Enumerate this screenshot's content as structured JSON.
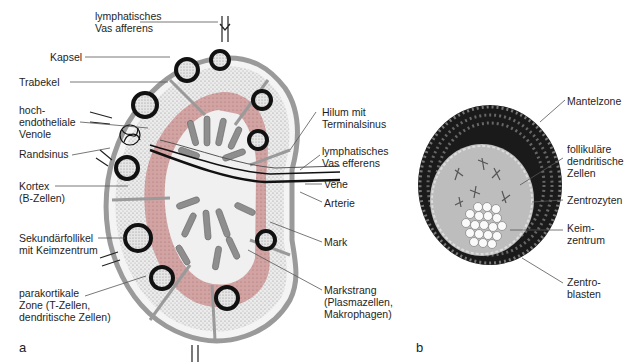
{
  "figure_a": {
    "panel_label": "a",
    "labels": {
      "vas_afferens_top": [
        "lymphatisches",
        "Vas afferens"
      ],
      "kapsel": [
        "Kapsel"
      ],
      "trabekel": [
        "Trabekel"
      ],
      "venole": [
        "hoch-",
        "endotheliale",
        "Venole"
      ],
      "randsinus": [
        "Randsinus"
      ],
      "kortex": [
        "Kortex",
        "(B-Zellen)"
      ],
      "sekundaerfollikel": [
        "Sekundärfollikel",
        "mit Keimzentrum"
      ],
      "parakortikal": [
        "parakortikale",
        "Zone (T-Zellen,",
        "dendritische Zellen)"
      ],
      "hilum": [
        "Hilum mit",
        "Terminalsinus"
      ],
      "vas_efferens": [
        "lymphatisches",
        "Vas efferens"
      ],
      "vene": [
        "Vene"
      ],
      "arterie": [
        "Arterie"
      ],
      "mark": [
        "Mark"
      ],
      "markstrang": [
        "Markstrang",
        "(Plasmazellen,",
        "Makrophagen)"
      ]
    }
  },
  "figure_b": {
    "panel_label": "b",
    "labels": {
      "mantelzone": [
        "Mantelzone"
      ],
      "fdc": [
        "follikuläre",
        "dendritische",
        "Zellen"
      ],
      "zentrozyten": [
        "Zentrozyten"
      ],
      "keimzentrum": [
        "Keim-",
        "zentrum"
      ],
      "zentroblasten": [
        "Zentro-",
        "blasten"
      ]
    }
  },
  "colors": {
    "capsule": "#9a9a9a",
    "cortex_stipple": "#d9d9d9",
    "paracortex": "#c98f8f",
    "medulla": "#8e8e8e",
    "follicle_ring": "#111111",
    "mantle_cells": "#1a1a1a",
    "germinal_center": "#bdbdbd"
  }
}
